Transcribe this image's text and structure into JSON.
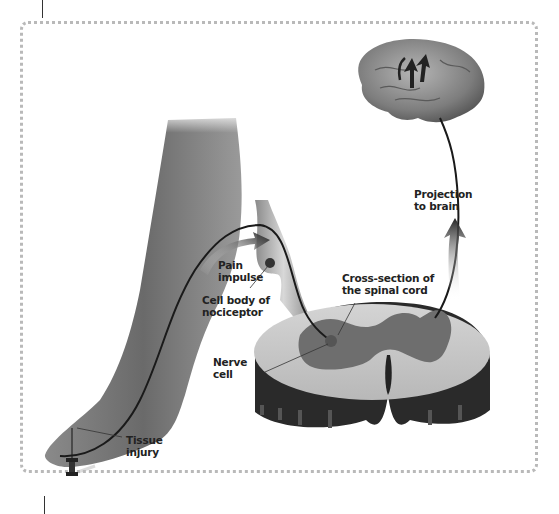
{
  "figure": {
    "type": "anatomical illustration",
    "labels": {
      "pain_impulse": "Pain\nimpulse",
      "cell_body": "Cell body of\nnociceptor",
      "nerve_cell": "Nerve\ncell",
      "cross_section": "Cross-section of\nthe spinal cord",
      "projection": "Projection\nto brain",
      "tissue_injury": "Tissue\ninjury"
    },
    "colors": {
      "frame_dots": "#b9b9b9",
      "label_text": "#222222",
      "nerve_line": "#1a1a1a",
      "spinal_white_matter": "#c8c8c8",
      "spinal_gray_matter": "#6e6e6e",
      "spinal_side": "#2a2a2a"
    }
  }
}
